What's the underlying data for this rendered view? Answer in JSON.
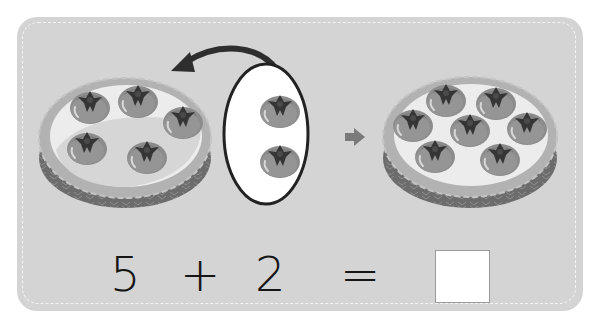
{
  "problem": {
    "left_basket": {
      "count": 5,
      "label": "basket with 5 persimmons"
    },
    "added_group": {
      "count": 2,
      "label": "group of 2 persimmons"
    },
    "result_basket": {
      "count": 7,
      "label": "basket with 7 persimmons"
    },
    "equation": {
      "operand1": "5",
      "operator": "+",
      "operand2": "2",
      "equals": "=",
      "answer": ""
    }
  },
  "colors": {
    "card_bg": "#d4d4d4",
    "dash": "#f4f4f4",
    "fruit": "#8a8a8a",
    "calyx": "#3a3a3a",
    "basket_rim": "#b4b4b4",
    "basket_body": "#6e6e6e",
    "basket_inner": "#ececec",
    "arrow": "#2e2e2e",
    "small_arrow": "#7a7a7a"
  },
  "icons": {
    "curved_arrow": "curved-arrow-icon",
    "right_arrow": "right-arrow-icon",
    "fruit": "persimmon-icon"
  }
}
